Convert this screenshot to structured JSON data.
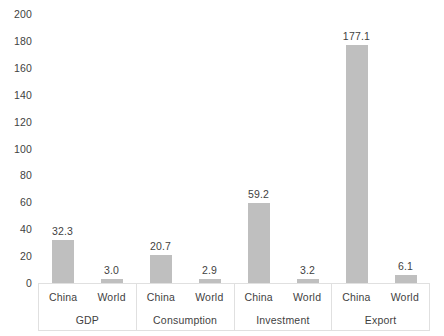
{
  "chart_data": {
    "type": "bar",
    "title": "",
    "subtitle": "",
    "xlabel": "",
    "ylabel": "",
    "ylim": [
      0,
      200
    ],
    "ytick_step": 20,
    "yticks": [
      "0",
      "20",
      "40",
      "60",
      "80",
      "100",
      "120",
      "140",
      "160",
      "180",
      "200"
    ],
    "grid": false,
    "legend": "none",
    "bar_color": "#bfbfbf",
    "axis_line_color": "#e0e0e0",
    "text_color": "#3f3f3f",
    "categories": [
      "GDP",
      "Consumption",
      "Investment",
      "Export"
    ],
    "subcategories": [
      "China",
      "World"
    ],
    "series": [
      {
        "name": "China",
        "values": [
          32.3,
          20.7,
          59.2,
          177.1
        ]
      },
      {
        "name": "World",
        "values": [
          3.0,
          2.9,
          3.2,
          6.1
        ]
      }
    ],
    "groups": [
      {
        "label": "GDP",
        "bars": [
          {
            "label": "China",
            "value": 32.3,
            "value_label": "32.3"
          },
          {
            "label": "World",
            "value": 3.0,
            "value_label": "3.0"
          }
        ]
      },
      {
        "label": "Consumption",
        "bars": [
          {
            "label": "China",
            "value": 20.7,
            "value_label": "20.7"
          },
          {
            "label": "World",
            "value": 2.9,
            "value_label": "2.9"
          }
        ]
      },
      {
        "label": "Investment",
        "bars": [
          {
            "label": "China",
            "value": 59.2,
            "value_label": "59.2"
          },
          {
            "label": "World",
            "value": 3.2,
            "value_label": "3.2"
          }
        ]
      },
      {
        "label": "Export",
        "bars": [
          {
            "label": "China",
            "value": 177.1,
            "value_label": "177.1"
          },
          {
            "label": "World",
            "value": 6.1,
            "value_label": "6.1"
          }
        ]
      }
    ]
  }
}
